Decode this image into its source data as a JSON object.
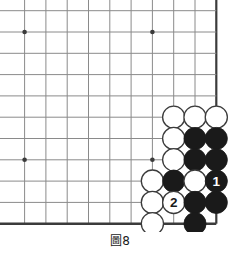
{
  "figure": {
    "caption_prefix": "圖",
    "caption_number": "8",
    "caption_full": "圖8"
  },
  "board": {
    "type": "go-board-corner",
    "description": "Go (Weiqi) problem diagram, lower-right corner of a 19x19 board",
    "line_color": "#8a8a8a",
    "edge_color": "#3b3b3b",
    "background_color": "#ffffff",
    "black_stone_color": "#1a1a1a",
    "white_stone_color": "#ffffff",
    "white_stone_border": "#3b3b3b",
    "columns_visible": 10,
    "rows_visible": 10,
    "spacing_px": 21.3,
    "origin_x": 24.6,
    "origin_y": 10.7,
    "right_edge_col": 9,
    "bottom_edge_row": 10,
    "star_points": [
      {
        "col": 0,
        "row": 1
      },
      {
        "col": 6,
        "row": 1
      },
      {
        "col": 0,
        "row": 7
      },
      {
        "col": 6,
        "row": 7
      }
    ],
    "stones": [
      {
        "col": 7,
        "row": 5,
        "color": "white",
        "label": ""
      },
      {
        "col": 8,
        "row": 5,
        "color": "white",
        "label": ""
      },
      {
        "col": 9,
        "row": 5,
        "color": "white",
        "label": ""
      },
      {
        "col": 7,
        "row": 6,
        "color": "white",
        "label": ""
      },
      {
        "col": 8,
        "row": 6,
        "color": "black",
        "label": ""
      },
      {
        "col": 9,
        "row": 6,
        "color": "black",
        "label": ""
      },
      {
        "col": 7,
        "row": 7,
        "color": "white",
        "label": ""
      },
      {
        "col": 8,
        "row": 7,
        "color": "black",
        "label": ""
      },
      {
        "col": 9,
        "row": 7,
        "color": "black",
        "label": ""
      },
      {
        "col": 6,
        "row": 8,
        "color": "white",
        "label": ""
      },
      {
        "col": 7,
        "row": 8,
        "color": "black",
        "label": ""
      },
      {
        "col": 8,
        "row": 8,
        "color": "white",
        "label": ""
      },
      {
        "col": 9,
        "row": 8,
        "color": "black",
        "label": "1"
      },
      {
        "col": 6,
        "row": 9,
        "color": "white",
        "label": ""
      },
      {
        "col": 7,
        "row": 9,
        "color": "white",
        "label": "2"
      },
      {
        "col": 8,
        "row": 9,
        "color": "black",
        "label": ""
      },
      {
        "col": 9,
        "row": 9,
        "color": "black",
        "label": ""
      },
      {
        "col": 6,
        "row": 10,
        "color": "white",
        "label": ""
      },
      {
        "col": 8,
        "row": 10,
        "color": "black",
        "label": ""
      }
    ],
    "move_labels": [
      {
        "number": "1",
        "color": "black",
        "label_color": "#ffffff"
      },
      {
        "number": "2",
        "color": "white",
        "label_color": "#1a1a1a"
      }
    ]
  }
}
